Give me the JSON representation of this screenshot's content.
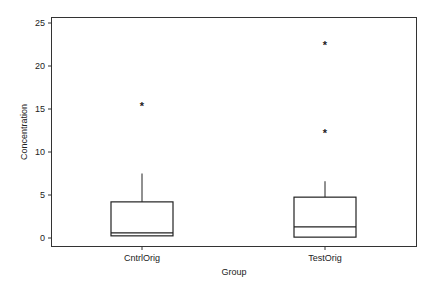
{
  "chart_data": {
    "type": "boxplot",
    "title": "",
    "xlabel": "Group",
    "ylabel": "Concentration",
    "ylim": [
      -1.5,
      25.5
    ],
    "yticks": [
      0,
      5,
      10,
      15,
      20,
      25
    ],
    "grid": false,
    "legend": null,
    "categories": [
      "CntrlOrig",
      "TestOrig"
    ],
    "series": [
      {
        "name": "CntrlOrig",
        "whisker_low": 0.25,
        "q1": 0.25,
        "median": 0.6,
        "q3": 4.2,
        "whisker_high": 7.5,
        "outliers": [
          15.5
        ]
      },
      {
        "name": "TestOrig",
        "whisker_low": 0.1,
        "q1": 0.1,
        "median": 1.3,
        "q3": 4.75,
        "whisker_high": 6.6,
        "outliers": [
          12.3,
          22.6
        ]
      }
    ],
    "outlier_marker": "*"
  },
  "colors": {
    "axis": "#333333",
    "box": "#222222",
    "background": "#ffffff"
  }
}
